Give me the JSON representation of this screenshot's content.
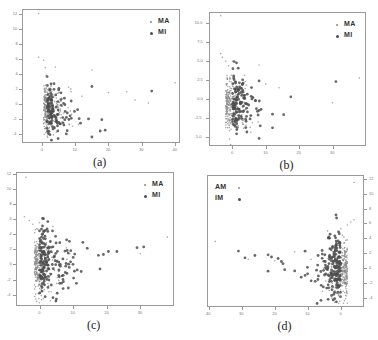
{
  "chart_data": [
    {
      "id": "a",
      "type": "scatter",
      "caption": "(a)",
      "title": "",
      "xlabel": "",
      "ylabel": "",
      "xticks": [
        "0",
        "10",
        "20",
        "30",
        "40"
      ],
      "yticks": [
        "-4",
        "-2",
        "0",
        "2",
        "4",
        "6",
        "8",
        "10",
        "12"
      ],
      "xlim": [
        -6,
        41.5
      ],
      "ylim": [
        -5.2,
        12.6
      ],
      "yaxis_side": "left",
      "x_reversed": false,
      "legend": [
        {
          "label": "MA",
          "marker": "small"
        },
        {
          "label": "MI",
          "marker": "large"
        }
      ],
      "legend_position": "upper right",
      "grid": false,
      "frame_px": [
        22,
        9,
        158,
        134
      ],
      "series": [
        {
          "name": "MA",
          "cluster": {
            "cx": 0.5,
            "cy": -0.5,
            "sx": 2.2,
            "sy": 1.6,
            "n": 260,
            "seed": 11
          },
          "outliers": [
            [
              -1,
              12
            ],
            [
              -1,
              6.2
            ],
            [
              0.5,
              5.8
            ],
            [
              1,
              4.8
            ],
            [
              4,
              4.9
            ],
            [
              15,
              4.5
            ],
            [
              20,
              1.5
            ],
            [
              25.5,
              1.6
            ],
            [
              28,
              0.5
            ],
            [
              32,
              0.1
            ],
            [
              40,
              2.8
            ],
            [
              11,
              -2.7
            ],
            [
              8,
              2.2
            ],
            [
              12,
              1.0
            ]
          ]
        },
        {
          "name": "MI",
          "cluster": {
            "cx": 1.5,
            "cy": -1.0,
            "sx": 2.5,
            "sy": 1.5,
            "n": 120,
            "seed": 23
          },
          "outliers": [
            [
              15,
              2.3
            ],
            [
              33,
              1.7
            ],
            [
              15,
              -4.4
            ],
            [
              19,
              -3.5
            ],
            [
              17.5,
              -3.6
            ],
            [
              14,
              -2.0
            ],
            [
              18,
              -2.1
            ]
          ]
        }
      ]
    },
    {
      "id": "b",
      "type": "scatter",
      "caption": "(b)",
      "title": "",
      "xlabel": "",
      "ylabel": "",
      "xticks": [
        "0",
        "10",
        "20",
        "30"
      ],
      "yticks": [
        "-5.0",
        "-2.5",
        "0.0",
        "2.5",
        "5.0",
        "7.5",
        "10.0"
      ],
      "xlim": [
        -7,
        40
      ],
      "ylim": [
        -6.2,
        11.5
      ],
      "yaxis_side": "left",
      "x_reversed": false,
      "legend": [
        {
          "label": "MA",
          "marker": "small"
        },
        {
          "label": "MI",
          "marker": "large"
        }
      ],
      "legend_position": "upper right",
      "grid": false,
      "frame_px": [
        209,
        12,
        157,
        134
      ],
      "series": [
        {
          "name": "MA",
          "cluster": {
            "cx": -2,
            "cy": -0.8,
            "sx": 2.2,
            "sy": 1.8,
            "n": 250,
            "seed": 31
          },
          "outliers": [
            [
              -3.5,
              11
            ],
            [
              -3.5,
              6
            ],
            [
              -3,
              5.5
            ],
            [
              -2,
              5
            ],
            [
              0,
              5
            ],
            [
              8,
              4.5
            ],
            [
              14,
              1.5
            ],
            [
              10,
              2
            ],
            [
              30,
              -0.5
            ],
            [
              38,
              2.8
            ]
          ]
        },
        {
          "name": "MI",
          "cluster": {
            "cx": 0,
            "cy": -0.5,
            "sx": 3,
            "sy": 1.8,
            "n": 130,
            "seed": 47
          },
          "outliers": [
            [
              31,
              2.3
            ],
            [
              17.5,
              0.3
            ],
            [
              8,
              -5.2
            ],
            [
              12,
              -3.8
            ],
            [
              12,
              -2
            ],
            [
              8,
              -1.5
            ],
            [
              8,
              2.4
            ],
            [
              4,
              -2.7
            ]
          ]
        }
      ]
    },
    {
      "id": "c",
      "type": "scatter",
      "caption": "(c)",
      "title": "",
      "xlabel": "",
      "ylabel": "",
      "xticks": [
        "0",
        "10",
        "20",
        "30"
      ],
      "yticks": [
        "-4",
        "-2",
        "0",
        "2",
        "4",
        "6",
        "8",
        "10",
        "12"
      ],
      "xlim": [
        -7,
        40
      ],
      "ylim": [
        -5.5,
        12.2
      ],
      "yaxis_side": "left",
      "x_reversed": false,
      "legend": [
        {
          "label": "MA",
          "marker": "small"
        },
        {
          "label": "MI",
          "marker": "large"
        }
      ],
      "legend_position": "upper right",
      "grid": false,
      "frame_px": [
        16,
        172,
        158,
        134
      ],
      "series": [
        {
          "name": "MA",
          "cluster": {
            "cx": -1.5,
            "cy": -0.3,
            "sx": 2.2,
            "sy": 2.0,
            "n": 250,
            "seed": 53
          },
          "outliers": [
            [
              -4,
              11.5
            ],
            [
              -4.5,
              6.3
            ],
            [
              -3,
              5.8
            ],
            [
              -2,
              5.3
            ],
            [
              0,
              5.5
            ],
            [
              4,
              5
            ],
            [
              14,
              2.2
            ],
            [
              8,
              2.2
            ],
            [
              9,
              1.4
            ],
            [
              9,
              0
            ],
            [
              30,
              1.4
            ],
            [
              38,
              3.6
            ]
          ]
        },
        {
          "name": "MI",
          "cluster": {
            "cx": 0,
            "cy": 0.2,
            "sx": 3.2,
            "sy": 2.2,
            "n": 170,
            "seed": 67
          },
          "outliers": [
            [
              17.5,
              1.2
            ],
            [
              19,
              1.3
            ],
            [
              20.5,
              1.7
            ],
            [
              23,
              1.7
            ],
            [
              29,
              2.2
            ],
            [
              31,
              2.3
            ],
            [
              18,
              -0.6
            ],
            [
              4,
              -4.4
            ],
            [
              6,
              -2.5
            ],
            [
              7,
              -3.2
            ]
          ]
        }
      ]
    },
    {
      "id": "d",
      "type": "scatter",
      "caption": "(d)",
      "title": "",
      "xlabel": "",
      "ylabel": "",
      "xticks": [
        "40",
        "30",
        "20",
        "10",
        "0"
      ],
      "yticks": [
        "-4",
        "-2",
        "0",
        "2",
        "4",
        "6",
        "8",
        "10",
        "12"
      ],
      "xlim": [
        40.5,
        -7
      ],
      "ylim": [
        -5.2,
        12.5
      ],
      "yaxis_side": "right",
      "x_reversed": true,
      "legend": [
        {
          "label": "AM",
          "marker": "small"
        },
        {
          "label": "IM",
          "marker": "large"
        }
      ],
      "legend_position": "upper left",
      "grid": false,
      "frame_px": [
        207,
        175,
        157,
        132
      ],
      "series": [
        {
          "name": "AM",
          "cluster": {
            "cx": -2,
            "cy": -0.3,
            "sx": 2.2,
            "sy": 2.0,
            "n": 260,
            "seed": 71
          },
          "outliers": [
            [
              -4,
              11.5
            ],
            [
              -4,
              6.5
            ],
            [
              -3,
              6.2
            ],
            [
              -2,
              5.8
            ],
            [
              0,
              5.3
            ],
            [
              4,
              5
            ],
            [
              14,
              2.2
            ],
            [
              9,
              1.2
            ],
            [
              38,
              3.6
            ],
            [
              28,
              1.2
            ],
            [
              20,
              1.0
            ]
          ]
        },
        {
          "name": "IM",
          "cluster": {
            "cx": 0,
            "cy": 0.2,
            "sx": 3.2,
            "sy": 2.3,
            "n": 180,
            "seed": 89
          },
          "outliers": [
            [
              31,
              2.3
            ],
            [
              29,
              1.4
            ],
            [
              26,
              1.7
            ],
            [
              22,
              1.8
            ],
            [
              21,
              1.5
            ],
            [
              19,
              1.3
            ],
            [
              18,
              0.9
            ],
            [
              17.5,
              0.6
            ],
            [
              22,
              -0.4
            ],
            [
              17,
              -0.2
            ],
            [
              12,
              -1.2
            ],
            [
              6,
              -4.3
            ]
          ]
        }
      ]
    }
  ],
  "colors": {
    "frame": "#9a9a9a",
    "small_marker": "#8a8a8a",
    "large_marker": "#4d4d4d",
    "tick_text": "#777777",
    "legend_text": "#333333"
  }
}
